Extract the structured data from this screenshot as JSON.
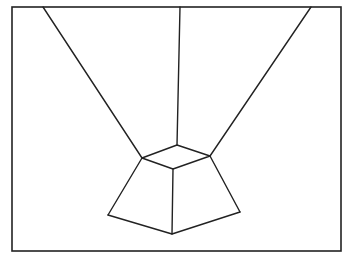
{
  "diagram": {
    "stroke_color": "#222222",
    "background": "#ffffff",
    "frame": {
      "x": 12,
      "y": 7,
      "width": 329,
      "height": 244
    },
    "vertices": {
      "top_back": [
        177,
        145
      ],
      "top_left": [
        142,
        158
      ],
      "top_right": [
        210,
        156
      ],
      "top_front": [
        173,
        169
      ],
      "bottom_left": [
        108,
        215
      ],
      "bottom_front": [
        172,
        234
      ],
      "bottom_right": [
        240,
        212
      ],
      "far_left": [
        43,
        7
      ],
      "far_center": [
        180,
        7
      ],
      "far_right": [
        311,
        7
      ]
    }
  }
}
